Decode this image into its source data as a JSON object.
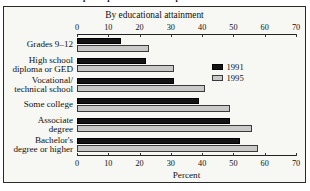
{
  "caption": {
    "text": "Adult education participation rates in the past 12 months: 1991 and 1995"
  },
  "figure": {
    "subtitle": "By educational attainment",
    "xaxis_title": "Percent"
  },
  "legend": {
    "position": "right-inside",
    "items": [
      {
        "label": "1991",
        "color": "#141414",
        "swatch": "legend-swatch-1991"
      },
      {
        "label": "1995",
        "color": "#c9c9c7",
        "swatch": "legend-swatch-1995"
      }
    ]
  },
  "axis": {
    "ticks": [
      "0",
      "10",
      "20",
      "30",
      "40",
      "50",
      "60",
      "70"
    ],
    "min": 0,
    "max": 70,
    "step": 10
  },
  "chart_data": {
    "type": "bar",
    "orientation": "horizontal",
    "title": "Adult education participation rates in the past 12 months: 1991 and 1995",
    "subtitle": "By educational attainment",
    "xlabel": "Percent",
    "ylabel": "",
    "xlim": [
      0,
      70
    ],
    "xticks": [
      0,
      10,
      20,
      30,
      40,
      50,
      60,
      70
    ],
    "grid": false,
    "duplicate_axis": "top and bottom",
    "categories": [
      "Grades 9–12",
      "High school\ndiploma or GED",
      "Vocational/\ntechnical school",
      "Some college",
      "Associate\ndegree",
      "Bachelor's\ndegree or higher"
    ],
    "series": [
      {
        "name": "1991",
        "color": "#141414",
        "values": [
          14,
          22,
          31,
          39,
          49,
          52
        ]
      },
      {
        "name": "1995",
        "color": "#c9c9c7",
        "values": [
          23,
          31,
          41,
          49,
          56,
          58
        ]
      }
    ]
  }
}
